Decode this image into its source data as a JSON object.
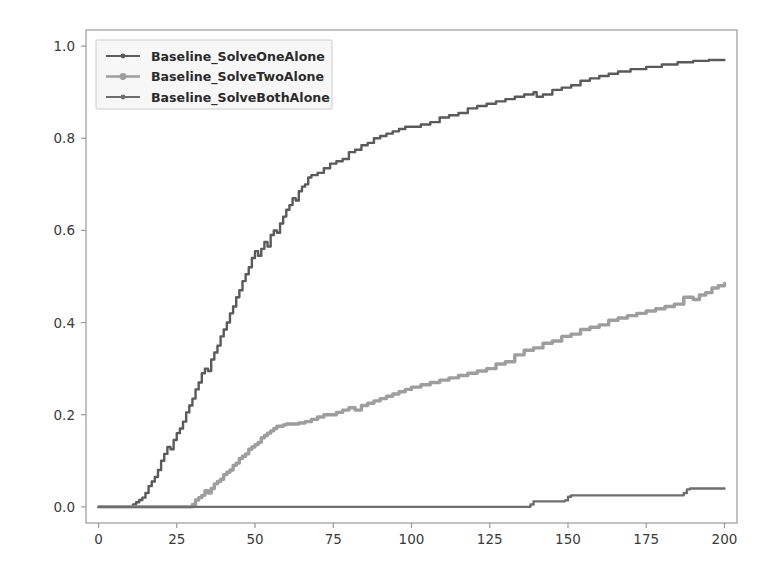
{
  "figure": {
    "background_color": "#ffffff",
    "axes_frame_color": "#9a9a9a",
    "tick_label_color": "#3a3a3a"
  },
  "legend": {
    "position": "upper-left",
    "background_color": "#f7f7f7",
    "border_color": "#cccccc",
    "entries": [
      {
        "label": "Baseline_SolveOneAlone",
        "color": "#5a5a5a",
        "marker": "line-marker-icon"
      },
      {
        "label": "Baseline_SolveTwoAlone",
        "color": "#9e9e9e",
        "marker": "line-marker-icon"
      },
      {
        "label": "Baseline_SolveBothAlone",
        "color": "#6e6e6e",
        "marker": "line-marker-icon"
      }
    ]
  },
  "chart_data": {
    "type": "line",
    "title": "",
    "xlabel": "",
    "ylabel": "",
    "xlim": [
      -4,
      204
    ],
    "ylim": [
      -0.035,
      1.035
    ],
    "grid": false,
    "legend_position": "upper left",
    "xticks": [
      0,
      25,
      50,
      75,
      100,
      125,
      150,
      175,
      200
    ],
    "xtick_labels": [
      "0",
      "25",
      "50",
      "75",
      "100",
      "125",
      "150",
      "175",
      "200"
    ],
    "yticks": [
      0.0,
      0.2,
      0.4,
      0.6,
      0.8,
      1.0
    ],
    "ytick_labels": [
      "0.0",
      "0.2",
      "0.4",
      "0.6",
      "0.8",
      "1.0"
    ],
    "series": [
      {
        "name": "Baseline_SolveOneAlone",
        "color": "#5a5a5a",
        "x": [
          0,
          5,
          10,
          11,
          12,
          13,
          14,
          15,
          16,
          17,
          18,
          19,
          20,
          21,
          22,
          23,
          24,
          25,
          26,
          27,
          28,
          29,
          30,
          31,
          32,
          33,
          34,
          35,
          36,
          37,
          38,
          39,
          40,
          41,
          42,
          43,
          44,
          45,
          46,
          47,
          48,
          49,
          50,
          51,
          52,
          53,
          54,
          55,
          56,
          57,
          58,
          59,
          60,
          61,
          62,
          63,
          64,
          65,
          66,
          67,
          68,
          70,
          72,
          74,
          76,
          78,
          80,
          82,
          84,
          86,
          88,
          90,
          92,
          94,
          96,
          98,
          100,
          103,
          106,
          109,
          112,
          115,
          118,
          121,
          124,
          127,
          130,
          133,
          136,
          139,
          140,
          142,
          145,
          148,
          151,
          154,
          157,
          160,
          163,
          166,
          170,
          175,
          180,
          185,
          190,
          195,
          200
        ],
        "y": [
          0.0,
          0.0,
          0.0,
          0.005,
          0.01,
          0.015,
          0.02,
          0.03,
          0.045,
          0.055,
          0.065,
          0.08,
          0.1,
          0.115,
          0.13,
          0.125,
          0.145,
          0.16,
          0.17,
          0.185,
          0.205,
          0.22,
          0.235,
          0.255,
          0.27,
          0.29,
          0.3,
          0.295,
          0.32,
          0.335,
          0.35,
          0.37,
          0.385,
          0.4,
          0.42,
          0.435,
          0.455,
          0.47,
          0.49,
          0.505,
          0.52,
          0.54,
          0.555,
          0.545,
          0.56,
          0.575,
          0.565,
          0.59,
          0.6,
          0.595,
          0.615,
          0.63,
          0.645,
          0.655,
          0.67,
          0.665,
          0.685,
          0.695,
          0.7,
          0.715,
          0.72,
          0.725,
          0.735,
          0.745,
          0.75,
          0.755,
          0.77,
          0.775,
          0.785,
          0.79,
          0.8,
          0.805,
          0.81,
          0.815,
          0.82,
          0.825,
          0.825,
          0.83,
          0.835,
          0.845,
          0.85,
          0.855,
          0.865,
          0.87,
          0.875,
          0.88,
          0.885,
          0.89,
          0.895,
          0.9,
          0.89,
          0.895,
          0.905,
          0.91,
          0.915,
          0.925,
          0.93,
          0.935,
          0.94,
          0.945,
          0.95,
          0.955,
          0.96,
          0.965,
          0.968,
          0.97,
          0.97
        ]
      },
      {
        "name": "Baseline_SolveTwoAlone",
        "color": "#9e9e9e",
        "x": [
          0,
          10,
          20,
          28,
          30,
          31,
          32,
          33,
          34,
          35,
          36,
          37,
          38,
          39,
          40,
          41,
          42,
          43,
          44,
          45,
          46,
          47,
          48,
          49,
          50,
          51,
          52,
          53,
          54,
          55,
          56,
          57,
          58,
          59,
          60,
          62,
          64,
          66,
          68,
          70,
          72,
          74,
          76,
          78,
          80,
          82,
          84,
          86,
          88,
          90,
          92,
          94,
          96,
          98,
          100,
          103,
          106,
          109,
          112,
          115,
          118,
          121,
          124,
          127,
          130,
          133,
          136,
          139,
          142,
          145,
          148,
          151,
          154,
          157,
          160,
          163,
          166,
          169,
          172,
          175,
          178,
          181,
          184,
          187,
          190,
          192,
          194,
          196,
          198,
          200
        ],
        "y": [
          0.0,
          0.0,
          0.0,
          0.0,
          0.005,
          0.015,
          0.02,
          0.025,
          0.035,
          0.03,
          0.04,
          0.05,
          0.055,
          0.06,
          0.07,
          0.075,
          0.08,
          0.09,
          0.095,
          0.105,
          0.11,
          0.115,
          0.125,
          0.13,
          0.135,
          0.14,
          0.15,
          0.155,
          0.16,
          0.165,
          0.17,
          0.175,
          0.175,
          0.178,
          0.18,
          0.18,
          0.182,
          0.185,
          0.19,
          0.195,
          0.2,
          0.2,
          0.205,
          0.21,
          0.215,
          0.21,
          0.22,
          0.225,
          0.23,
          0.235,
          0.24,
          0.245,
          0.25,
          0.255,
          0.26,
          0.265,
          0.27,
          0.275,
          0.28,
          0.285,
          0.29,
          0.295,
          0.3,
          0.31,
          0.315,
          0.33,
          0.34,
          0.345,
          0.355,
          0.36,
          0.37,
          0.375,
          0.385,
          0.39,
          0.395,
          0.405,
          0.41,
          0.415,
          0.42,
          0.425,
          0.43,
          0.435,
          0.44,
          0.455,
          0.45,
          0.46,
          0.465,
          0.475,
          0.48,
          0.485
        ]
      },
      {
        "name": "Baseline_SolveBothAlone",
        "color": "#6e6e6e",
        "x": [
          0,
          20,
          40,
          60,
          80,
          100,
          120,
          135,
          137,
          138,
          139,
          145,
          148,
          149,
          150,
          151,
          160,
          170,
          180,
          186,
          187,
          188,
          189,
          195,
          200
        ],
        "y": [
          0.0,
          0.0,
          0.0,
          0.0,
          0.0,
          0.0,
          0.0,
          0.0,
          0.0,
          0.005,
          0.012,
          0.012,
          0.012,
          0.014,
          0.022,
          0.025,
          0.025,
          0.025,
          0.025,
          0.025,
          0.03,
          0.038,
          0.04,
          0.04,
          0.04
        ]
      }
    ]
  }
}
